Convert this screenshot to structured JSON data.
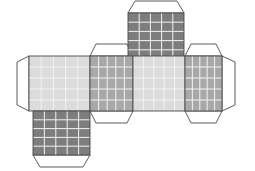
{
  "figure": {
    "background_color": "#ffffff",
    "canvas": {
      "width": 255,
      "height": 171
    }
  },
  "style": {
    "stroke_color": "#4a4a4a",
    "stroke_width": 0.9,
    "tab_fill": "#ffffff",
    "grid_line_color": "#f2f2f2",
    "grid_line_width": 1.0,
    "shade_light": "#dcdcdc",
    "shade_medium": "#a8a8a8",
    "shade_dark": "#7d7d7d"
  },
  "grid": {
    "divisions": 5,
    "label": "5 by 5 square grid"
  },
  "faces": [
    {
      "id": "face-top",
      "name": "top-face",
      "shade": "dark",
      "fill": "#7d7d7d",
      "x": 128,
      "y": 13,
      "w": 56,
      "h": 46
    },
    {
      "id": "face-left",
      "name": "left-face",
      "shade": "light",
      "fill": "#dcdcdc",
      "x": 29,
      "y": 56,
      "w": 61,
      "h": 55
    },
    {
      "id": "face-front",
      "name": "front-face",
      "shade": "medium",
      "fill": "#a8a8a8",
      "x": 90,
      "y": 56,
      "w": 43,
      "h": 55
    },
    {
      "id": "face-right",
      "name": "right-face",
      "shade": "light",
      "fill": "#dcdcdc",
      "x": 133,
      "y": 56,
      "w": 52,
      "h": 55
    },
    {
      "id": "face-back",
      "name": "back-face",
      "shade": "medium",
      "fill": "#a8a8a8",
      "x": 185,
      "y": 56,
      "w": 37,
      "h": 55
    },
    {
      "id": "face-bottom",
      "name": "bottom-face",
      "shade": "dark",
      "fill": "#7d7d7d",
      "x": 33,
      "y": 111,
      "w": 57,
      "h": 44
    }
  ],
  "tabs": [
    {
      "id": "tab-top",
      "name": "glue-tab-top",
      "edge": "top",
      "inset": 7,
      "depth": 12,
      "x": 128,
      "y": 13,
      "w": 56
    },
    {
      "id": "tab-front-top",
      "name": "glue-tab-front-top",
      "edge": "top",
      "inset": 6,
      "depth": 12,
      "x": 90,
      "y": 56,
      "w": 43
    },
    {
      "id": "tab-front-bottom",
      "name": "glue-tab-front-bottom",
      "edge": "bottom",
      "inset": 6,
      "depth": 12,
      "x": 90,
      "y": 111,
      "w": 43
    },
    {
      "id": "tab-back-top",
      "name": "glue-tab-back-top",
      "edge": "top",
      "inset": 6,
      "depth": 12,
      "x": 185,
      "y": 56,
      "w": 37
    },
    {
      "id": "tab-back-bottom",
      "name": "glue-tab-back-bottom",
      "edge": "bottom",
      "inset": 6,
      "depth": 12,
      "x": 185,
      "y": 111,
      "w": 37
    },
    {
      "id": "tab-left",
      "name": "glue-tab-left",
      "edge": "left",
      "inset": 6,
      "depth": 12,
      "x": 29,
      "y": 56,
      "h": 55
    },
    {
      "id": "tab-right",
      "name": "glue-tab-right",
      "edge": "right",
      "inset": 6,
      "depth": 13,
      "x": 222,
      "y": 56,
      "h": 55
    },
    {
      "id": "tab-bottom",
      "name": "glue-tab-bottom",
      "edge": "bottom",
      "inset": 7,
      "depth": 12,
      "x": 33,
      "y": 155,
      "w": 57
    }
  ]
}
